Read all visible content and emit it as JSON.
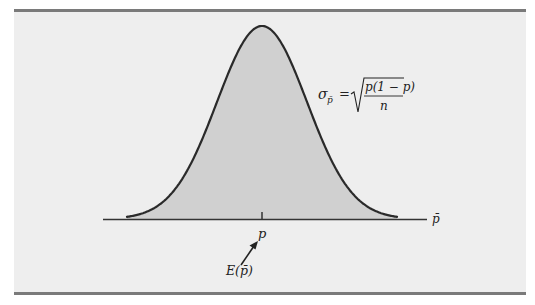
{
  "figure": {
    "type": "normal-distribution-diagram",
    "colors": {
      "panel_bg": "#eeeeee",
      "rule": "#7a7a7a",
      "curve_fill": "#d0d0d0",
      "curve_stroke": "#2a2a2a",
      "axis": "#333333",
      "text": "#222222"
    },
    "axis_label": "p̄",
    "center_label": "p",
    "expected_value_label": "E(p̄)",
    "formula": {
      "lhs_symbol": "σ",
      "lhs_subscript": "p̄",
      "equals": "=",
      "numerator": "p(1 − p)",
      "denominator": "n",
      "full_text": "σ_p̄ = √(p(1 − p) / n)"
    }
  }
}
